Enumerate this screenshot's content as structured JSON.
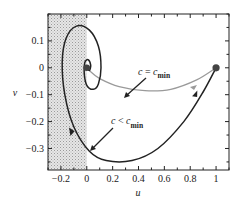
{
  "chart_data": {
    "type": "line",
    "title": "",
    "xlabel": "u",
    "ylabel": "v",
    "xlim": [
      -0.3,
      1.1
    ],
    "ylim": [
      -0.38,
      0.2
    ],
    "grid": false,
    "x_ticks": [
      -0.2,
      0,
      0.2,
      0.4,
      0.6,
      0.8,
      1
    ],
    "x_tick_labels": [
      "−0.2",
      "0",
      "0.2",
      "0.4",
      "0.6",
      "0.8",
      "1"
    ],
    "y_ticks": [
      0.1,
      0,
      -0.1,
      -0.2,
      -0.3
    ],
    "y_tick_labels": [
      "0.1",
      "0",
      "−0.1",
      "−0.2",
      "−0.3"
    ],
    "shaded_region": {
      "u_from": -0.3,
      "u_to": 0,
      "description": "u < 0 forbidden region (stippled gray)"
    },
    "fixed_points": [
      {
        "name": "saddle",
        "u": 1,
        "v": 0
      },
      {
        "name": "origin",
        "u": 0,
        "v": 0
      }
    ],
    "series": [
      {
        "name": "c = c_min",
        "color": "#999999",
        "points": [
          [
            1,
            0
          ],
          [
            0.85,
            -0.045
          ],
          [
            0.65,
            -0.08
          ],
          [
            0.45,
            -0.085
          ],
          [
            0.25,
            -0.07
          ],
          [
            0.1,
            -0.04
          ],
          [
            0.02,
            -0.01
          ],
          [
            0,
            0
          ]
        ]
      },
      {
        "name": "c < c_min",
        "color": "#222222",
        "points": [
          [
            1,
            0
          ],
          [
            0.9,
            -0.09
          ],
          [
            0.75,
            -0.2
          ],
          [
            0.55,
            -0.3
          ],
          [
            0.35,
            -0.345
          ],
          [
            0.15,
            -0.345
          ],
          [
            0.02,
            -0.31
          ],
          [
            -0.1,
            -0.22
          ],
          [
            -0.17,
            -0.1
          ],
          [
            -0.19,
            0.02
          ],
          [
            -0.16,
            0.11
          ],
          [
            -0.08,
            0.155
          ],
          [
            0.02,
            0.14
          ],
          [
            0.09,
            0.08
          ],
          [
            0.11,
            0.0
          ],
          [
            0.09,
            -0.06
          ],
          [
            0.05,
            -0.08
          ],
          [
            0.0,
            -0.065
          ],
          [
            -0.02,
            -0.02
          ],
          [
            -0.015,
            0.02
          ],
          [
            0.01,
            0.03
          ],
          [
            0.03,
            0.01
          ],
          [
            0.02,
            -0.01
          ],
          [
            0,
            0
          ]
        ]
      }
    ],
    "annotations": [
      {
        "text_c": "c",
        "text_eq": " = ",
        "text_cmin": "c",
        "text_sub": "min",
        "label": "c = c_min",
        "points_to": "gray trajectory"
      },
      {
        "text_c": "c",
        "text_eq": " < ",
        "text_cmin": "c",
        "text_sub": "min",
        "label": "c < c_min",
        "points_to": "black trajectory"
      }
    ]
  }
}
